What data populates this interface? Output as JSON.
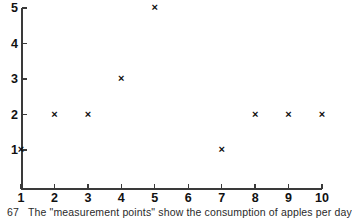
{
  "chart_data": {
    "type": "scatter",
    "title": "",
    "subtitle": "",
    "xlabel": "",
    "ylabel": "",
    "xlim": [
      1,
      10
    ],
    "ylim": [
      0,
      5
    ],
    "grid": false,
    "legend": null,
    "x_ticks": [
      "1",
      "2",
      "3",
      "4",
      "5",
      "6",
      "7",
      "8",
      "9",
      "10"
    ],
    "y_ticks": [
      "1",
      "2",
      "3",
      "4",
      "5"
    ],
    "marker": "x",
    "marker_color": "#0d0d0d",
    "points": [
      {
        "x": 1,
        "y": 1
      },
      {
        "x": 2,
        "y": 2
      },
      {
        "x": 3,
        "y": 2
      },
      {
        "x": 4,
        "y": 3
      },
      {
        "x": 5,
        "y": 5
      },
      {
        "x": 7,
        "y": 1
      },
      {
        "x": 8,
        "y": 2
      },
      {
        "x": 9,
        "y": 2
      },
      {
        "x": 10,
        "y": 2
      }
    ],
    "missing_x": [
      6
    ],
    "annotations": []
  },
  "caption": {
    "number": "67",
    "text": "The \"measurement points\" show the consumption of apples per day"
  },
  "colors": {
    "axis": "#3a3a3a",
    "text": "#111111",
    "marker": "#0d0d0d",
    "background": "#ffffff"
  }
}
